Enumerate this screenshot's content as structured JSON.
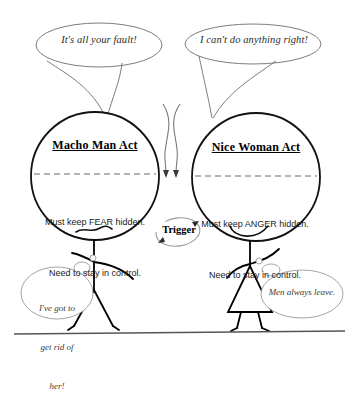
{
  "diagram": {
    "title_left": "Macho Man Act",
    "title_right": "Nice Woman Act",
    "left_bubble": "It's all your fault!",
    "right_bubble": "I can't do anything right!",
    "left_body_line1": "Must keep FEAR hidden.",
    "left_body_line2": "Need to stay in control.",
    "right_body_line1": "Must keep ANGER hidden.",
    "right_body_line2": "Need to stay in control.",
    "trigger_label": "Trigger",
    "bottom_left_bubble_line1": "I've got to",
    "bottom_left_bubble_line2": "get rid of",
    "bottom_left_bubble_line3": "her!",
    "bottom_right_bubble": "Men always leave.",
    "colors": {
      "ink": "#000000",
      "light_ink": "#5a5a5a",
      "background": "#ffffff",
      "dashed_line": "#6b6b6b",
      "ground_line": "#555555"
    }
  }
}
